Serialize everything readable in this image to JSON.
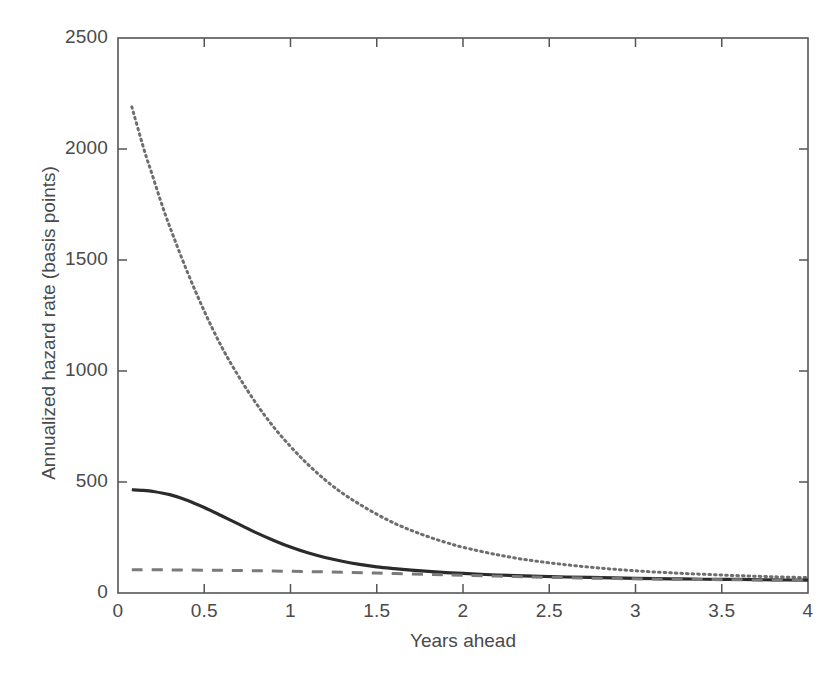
{
  "chart_data": {
    "type": "line",
    "title": "",
    "xlabel": "Years ahead",
    "ylabel": "Annualized hazard rate (basis points)",
    "xlim": [
      0,
      4
    ],
    "ylim": [
      0,
      2500
    ],
    "xticks": [
      "0",
      "0.5",
      "1",
      "1.5",
      "2",
      "2.5",
      "3",
      "3.5",
      "4"
    ],
    "xtick_values": [
      0,
      0.5,
      1,
      1.5,
      2,
      2.5,
      3,
      3.5,
      4
    ],
    "yticks": [
      "0",
      "500",
      "1000",
      "1500",
      "2000",
      "2500"
    ],
    "ytick_values": [
      0,
      500,
      1000,
      1500,
      2000,
      2500
    ],
    "grid": false,
    "legend": "none",
    "frame": "box-with-inward-ticks",
    "series": [
      {
        "name": "dotted-curve",
        "style": "dotted",
        "color": "#6e6e6e",
        "x": [
          0.08,
          0.15,
          0.2,
          0.25,
          0.3,
          0.4,
          0.5,
          0.6,
          0.7,
          0.8,
          0.9,
          1.0,
          1.1,
          1.2,
          1.3,
          1.4,
          1.5,
          1.6,
          1.7,
          1.8,
          1.9,
          2.0,
          2.2,
          2.4,
          2.6,
          2.8,
          3.0,
          3.2,
          3.4,
          3.6,
          3.8,
          4.0
        ],
        "values": [
          2190,
          2000,
          1880,
          1760,
          1650,
          1450,
          1270,
          1110,
          975,
          855,
          750,
          660,
          580,
          510,
          450,
          400,
          355,
          315,
          282,
          253,
          228,
          206,
          172,
          146,
          127,
          112,
          100,
          91,
          84,
          78,
          73,
          69
        ]
      },
      {
        "name": "solid-curve",
        "style": "solid",
        "color": "#2b2b2b",
        "x": [
          0.08,
          0.15,
          0.2,
          0.3,
          0.4,
          0.5,
          0.6,
          0.7,
          0.8,
          0.9,
          1.0,
          1.1,
          1.2,
          1.3,
          1.4,
          1.5,
          1.6,
          1.7,
          1.8,
          1.9,
          2.0,
          2.2,
          2.4,
          2.6,
          2.8,
          3.0,
          3.2,
          3.4,
          3.6,
          3.8,
          4.0
        ],
        "values": [
          465,
          462,
          458,
          443,
          418,
          385,
          348,
          310,
          272,
          238,
          207,
          181,
          160,
          143,
          129,
          118,
          110,
          103,
          97,
          92,
          88,
          81,
          76,
          72,
          69,
          66,
          64,
          62,
          61,
          59,
          58
        ]
      },
      {
        "name": "dashed-curve",
        "style": "dashed",
        "color": "#7a7a7a",
        "x": [
          0.08,
          0.3,
          0.6,
          0.9,
          1.2,
          1.5,
          1.8,
          2.0,
          2.3,
          2.6,
          2.9,
          3.2,
          3.5,
          3.8,
          4.0
        ],
        "values": [
          105,
          104,
          102,
          99,
          95,
          90,
          84,
          80,
          74,
          69,
          65,
          62,
          60,
          58,
          57
        ]
      }
    ]
  },
  "axes": {
    "plot_left_px": 118,
    "plot_right_px": 808,
    "plot_top_px": 38,
    "plot_bottom_px": 593
  }
}
